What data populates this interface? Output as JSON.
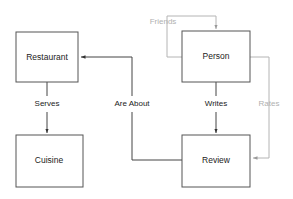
{
  "diagram": {
    "canvas": {
      "width": 293,
      "height": 199,
      "background": "#ffffff"
    },
    "colors": {
      "node_stroke": "#555555",
      "node_fill": "#ffffff",
      "node_text": "#222222",
      "edge_primary": "#444444",
      "edge_muted": "#b4b4b4",
      "label_primary": "#222222",
      "label_muted": "#b0b0b0"
    },
    "nodes": [
      {
        "id": "restaurant",
        "label": "Restaurant",
        "x": 16,
        "y": 32,
        "width": 62,
        "height": 50
      },
      {
        "id": "cuisine",
        "label": "Cuisine",
        "x": 16,
        "y": 135,
        "width": 67,
        "height": 52
      },
      {
        "id": "person",
        "label": "Person",
        "x": 182,
        "y": 31,
        "width": 68,
        "height": 51
      },
      {
        "id": "review",
        "label": "Review",
        "x": 182,
        "y": 135,
        "width": 68,
        "height": 52
      }
    ],
    "edges": [
      {
        "id": "serves",
        "label": "Serves",
        "from": "restaurant",
        "to": "cuisine",
        "style": "primary",
        "label_x": 47,
        "label_y": 104
      },
      {
        "id": "are-about",
        "label": "Are About",
        "from": "review",
        "to": "restaurant",
        "style": "primary",
        "label_x": 132,
        "label_y": 104
      },
      {
        "id": "writes",
        "label": "Writes",
        "from": "person",
        "to": "review",
        "style": "primary",
        "label_x": 216,
        "label_y": 104
      },
      {
        "id": "rates",
        "label": "Rates",
        "from": "person",
        "to": "review",
        "style": "muted",
        "label_x": 269,
        "label_y": 104
      },
      {
        "id": "friends",
        "label": "Friends",
        "from": "person",
        "to": "person",
        "style": "muted",
        "label_x": 163,
        "label_y": 22
      }
    ]
  }
}
